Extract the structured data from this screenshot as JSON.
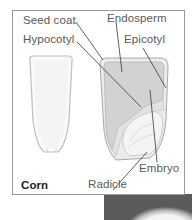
{
  "figure": {
    "title": "Corn",
    "labels": {
      "seed_coat": "Seed coat",
      "endosperm": "Endosperm",
      "hypocotyl": "Hypocotyl",
      "epicotyl": "Epicotyl",
      "embryo": "Embryo",
      "radicle": "Radicle"
    }
  },
  "colors": {
    "frame_border": "#9a9a9a",
    "label_text": "#5a5a5a",
    "title_text": "#222222",
    "endosperm_fill": "#d2d2d2",
    "embryo_fill": "#f2f2f2",
    "photo_bg": "#5a5a5a"
  }
}
